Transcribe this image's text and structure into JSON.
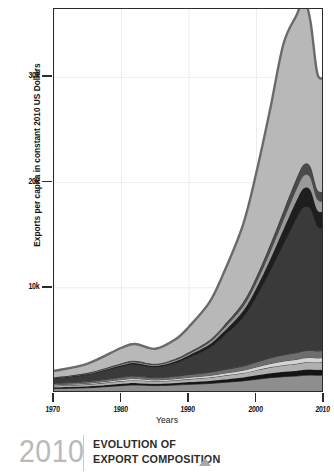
{
  "chart_data": {
    "type": "area",
    "title": "EVOLUTION OF EXPORT COMPOSITION",
    "subtitle": "2010",
    "xlabel": "Years",
    "ylabel": "Exports per capita in constant 2010 US Dollars",
    "stacked": true,
    "grid": true,
    "legend_position": "none",
    "xlim": [
      1970,
      2010
    ],
    "ylim": [
      0,
      36500
    ],
    "xticks": [
      1970,
      1980,
      1990,
      2000,
      2010
    ],
    "xticklabels": [
      "1970",
      "1980",
      "1990",
      "2000",
      "2010"
    ],
    "yticks": [
      10000,
      20000,
      30000
    ],
    "yticklabels": [
      "10k",
      "20k",
      "30k"
    ],
    "x": [
      1970,
      1975,
      1980,
      1982,
      1985,
      1988,
      1990,
      1993,
      1995,
      1998,
      2000,
      2002,
      2004,
      2006,
      2007,
      2008,
      2009,
      2010
    ],
    "series": [
      {
        "name": "layer-1",
        "color": "#8e8e8e",
        "values": [
          420,
          500,
          700,
          760,
          700,
          760,
          820,
          900,
          1000,
          1150,
          1300,
          1450,
          1550,
          1620,
          1680,
          1700,
          1680,
          1700
        ]
      },
      {
        "name": "layer-2",
        "color": "#141414",
        "values": [
          120,
          140,
          190,
          200,
          180,
          200,
          220,
          250,
          280,
          330,
          380,
          430,
          470,
          500,
          520,
          530,
          520,
          530
        ]
      },
      {
        "name": "layer-3",
        "color": "#b0b0b0",
        "values": [
          150,
          180,
          240,
          260,
          230,
          250,
          280,
          320,
          360,
          420,
          490,
          560,
          620,
          660,
          690,
          700,
          690,
          700
        ]
      },
      {
        "name": "layer-4",
        "color": "#d4d4d4",
        "values": [
          90,
          110,
          150,
          160,
          140,
          155,
          175,
          200,
          225,
          265,
          310,
          355,
          395,
          425,
          445,
          450,
          445,
          450
        ]
      },
      {
        "name": "layer-5",
        "color": "#6e6e6e",
        "values": [
          130,
          160,
          210,
          225,
          200,
          220,
          250,
          290,
          330,
          390,
          455,
          525,
          585,
          630,
          660,
          670,
          660,
          670
        ]
      },
      {
        "name": "layer-6",
        "color": "#3a3a3a",
        "values": [
          430,
          620,
          1000,
          1080,
          980,
          1250,
          1600,
          2300,
          3100,
          4600,
          6200,
          8200,
          10500,
          12800,
          13600,
          13400,
          11800,
          11600
        ]
      },
      {
        "name": "layer-7",
        "color": "#1e1e1e",
        "values": [
          60,
          90,
          150,
          165,
          150,
          190,
          240,
          340,
          450,
          650,
          880,
          1150,
          1450,
          1750,
          1860,
          1830,
          1600,
          1580
        ]
      },
      {
        "name": "layer-8",
        "color": "#9a9a9a",
        "values": [
          45,
          65,
          105,
          115,
          105,
          130,
          165,
          230,
          305,
          440,
          590,
          770,
          960,
          1160,
          1230,
          1210,
          1060,
          1045
        ]
      },
      {
        "name": "layer-9",
        "color": "#4a4a4a",
        "values": [
          40,
          55,
          90,
          100,
          90,
          110,
          140,
          195,
          255,
          370,
          495,
          645,
          805,
          975,
          1035,
          1020,
          890,
          880
        ]
      },
      {
        "name": "layer-10",
        "color": "#b8b8b8",
        "values": [
          615,
          880,
          1465,
          1595,
          1425,
          1835,
          2410,
          3565,
          4900,
          7375,
          9900,
          12810,
          15865,
          15480,
          15780,
          13790,
          11055,
          10845
        ]
      }
    ],
    "totals": [
      2100,
      2800,
      4300,
      4660,
      4200,
      5100,
      6300,
      8590,
      11205,
      15990,
      21000,
      26895,
      33200,
      35000,
      36500,
      33300,
      29800,
      29400
    ],
    "annotations": []
  },
  "axes": {
    "y_title": "Exports per capita in constant 2010 US Dollars",
    "x_title": "Years",
    "y_ticks": [
      {
        "label": "30k",
        "value": 30000
      },
      {
        "label": "20k",
        "value": 20000
      },
      {
        "label": "10k",
        "value": 10000
      }
    ],
    "x_ticks": [
      {
        "label": "1970",
        "value": 1970
      },
      {
        "label": "1980",
        "value": 1980
      },
      {
        "label": "1990",
        "value": 1990
      },
      {
        "label": "2000",
        "value": 2000
      },
      {
        "label": "2010",
        "value": 2010
      }
    ]
  },
  "caption": {
    "year": "2010",
    "line1": "EVOLUTION OF",
    "line2": "EXPORT COMPOSITION",
    "marker_icon": "triangle-up-icon"
  },
  "colors": {
    "frame": "#2b2b2b",
    "grid": "#ededed",
    "caption_year": "#b9b9b9",
    "caption_text": "#2b2b2b",
    "caption_marker": "#a8a8a8"
  }
}
